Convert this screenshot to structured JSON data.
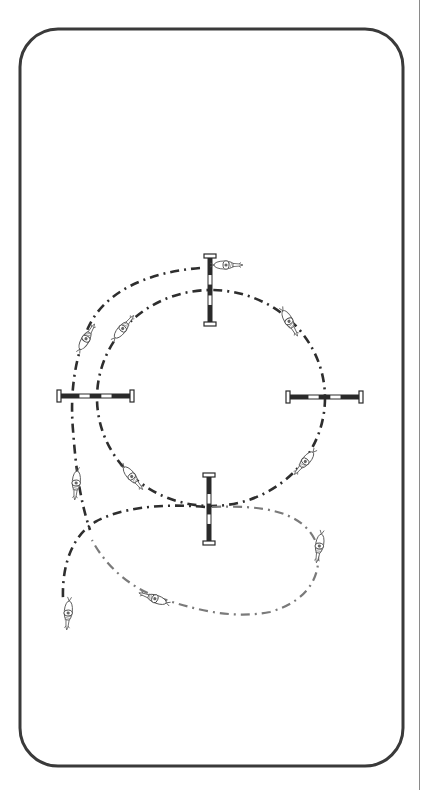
{
  "diagram": {
    "colors": {
      "arena_border": "#3a3a3a",
      "path_dark": "#2e2e2e",
      "path_gray": "#7a7a7a",
      "pole_dark": "#2a2a2a",
      "pole_light": "#ffffff",
      "page_rule": "#8a8a8a"
    },
    "arena": {
      "x": 20,
      "y": 29,
      "width": 383,
      "height": 737,
      "corner_radius": 38
    },
    "circle": {
      "cx": 211,
      "cy": 398,
      "rx": 114,
      "ry": 108
    },
    "jumps": [
      {
        "id": "top",
        "orientation": "vertical",
        "x": 210,
        "y1": 256,
        "y2": 324
      },
      {
        "id": "left",
        "orientation": "horizontal",
        "y": 396,
        "x1": 59,
        "x2": 132
      },
      {
        "id": "right",
        "orientation": "horizontal",
        "y": 397,
        "x1": 288,
        "x2": 361
      },
      {
        "id": "bottom",
        "orientation": "vertical",
        "x": 209,
        "y1": 475,
        "y2": 543
      }
    ],
    "paths": [
      {
        "id": "outer-approach",
        "style": "dark",
        "d": "M 200 268 C 150 272, 105 290, 88 328 C 74 360, 70 395, 73 430 C 76 470, 80 500, 90 530"
      },
      {
        "id": "exit-left",
        "style": "dark",
        "d": "M 205 507 C 160 503, 120 508, 95 522 C 72 536, 62 565, 63 598"
      },
      {
        "id": "exit-loop",
        "style": "gray",
        "d": "M 212 507 C 260 505, 300 510, 315 540 C 325 570, 312 600, 270 612 C 230 620, 190 608, 160 598 C 130 588, 105 565, 92 540"
      }
    ],
    "horses": [
      {
        "id": "horse-top",
        "x": 228,
        "y": 265,
        "angle": 0
      },
      {
        "id": "horse-upper-left-outer",
        "x": 87,
        "y": 337,
        "angle": -60
      },
      {
        "id": "horse-upper-left-inner",
        "x": 124,
        "y": 327,
        "angle": -50
      },
      {
        "id": "horse-upper-right",
        "x": 290,
        "y": 323,
        "angle": 60
      },
      {
        "id": "horse-lower-right",
        "x": 304,
        "y": 463,
        "angle": 130
      },
      {
        "id": "horse-lower-left-inner",
        "x": 133,
        "y": 478,
        "angle": 50
      },
      {
        "id": "horse-left-outer",
        "x": 76,
        "y": 485,
        "angle": 95
      },
      {
        "id": "horse-right-loop",
        "x": 319,
        "y": 548,
        "angle": 100
      },
      {
        "id": "horse-bottom",
        "x": 153,
        "y": 598,
        "angle": 200
      },
      {
        "id": "horse-exit-left",
        "x": 68,
        "y": 615,
        "angle": 95
      }
    ]
  }
}
